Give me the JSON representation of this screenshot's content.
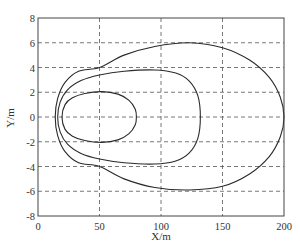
{
  "chart_data": {
    "type": "line",
    "title": "",
    "xlabel": "X/m",
    "ylabel": "Y/m",
    "xlim": [
      0,
      200
    ],
    "ylim": [
      -8,
      8
    ],
    "xticks": [
      0,
      50,
      100,
      150,
      200
    ],
    "yticks": [
      -8,
      -6,
      -4,
      -2,
      0,
      2,
      4,
      6,
      8
    ],
    "grid": true,
    "grid_style": "dashed",
    "legend": null,
    "series": [
      {
        "name": "inner loop",
        "closed": true,
        "points": [
          [
            19.5,
            0
          ],
          [
            22,
            1.0
          ],
          [
            28,
            1.55
          ],
          [
            38,
            1.9
          ],
          [
            52,
            2.05
          ],
          [
            65,
            1.85
          ],
          [
            74,
            1.35
          ],
          [
            79,
            0.65
          ],
          [
            80,
            0
          ],
          [
            79,
            -0.65
          ],
          [
            74,
            -1.35
          ],
          [
            65,
            -1.85
          ],
          [
            52,
            -2.05
          ],
          [
            38,
            -1.9
          ],
          [
            28,
            -1.55
          ],
          [
            22,
            -1.0
          ],
          [
            19.5,
            0
          ]
        ]
      },
      {
        "name": "middle loop",
        "closed": true,
        "points": [
          [
            16,
            0
          ],
          [
            18,
            1.2
          ],
          [
            24,
            2.2
          ],
          [
            35,
            2.95
          ],
          [
            50,
            3.4
          ],
          [
            70,
            3.7
          ],
          [
            95,
            3.8
          ],
          [
            112,
            3.55
          ],
          [
            123,
            2.9
          ],
          [
            130,
            1.7
          ],
          [
            132,
            0
          ],
          [
            130,
            -1.7
          ],
          [
            123,
            -2.9
          ],
          [
            112,
            -3.55
          ],
          [
            95,
            -3.8
          ],
          [
            70,
            -3.7
          ],
          [
            50,
            -3.4
          ],
          [
            35,
            -2.95
          ],
          [
            24,
            -2.2
          ],
          [
            18,
            -1.2
          ],
          [
            16,
            0
          ]
        ]
      },
      {
        "name": "outer loop",
        "closed": true,
        "points": [
          [
            14,
            0
          ],
          [
            16,
            1.5
          ],
          [
            22,
            2.8
          ],
          [
            33,
            3.7
          ],
          [
            50,
            4.0
          ],
          [
            70,
            5.0
          ],
          [
            95,
            5.7
          ],
          [
            123,
            6.0
          ],
          [
            150,
            5.6
          ],
          [
            172,
            4.6
          ],
          [
            188,
            3.2
          ],
          [
            197,
            1.6
          ],
          [
            200,
            0
          ],
          [
            197,
            -1.6
          ],
          [
            188,
            -3.2
          ],
          [
            172,
            -4.6
          ],
          [
            150,
            -5.6
          ],
          [
            123,
            -5.9
          ],
          [
            95,
            -5.7
          ],
          [
            70,
            -5.0
          ],
          [
            50,
            -4.0
          ],
          [
            33,
            -3.7
          ],
          [
            22,
            -2.8
          ],
          [
            16,
            -1.5
          ],
          [
            14,
            0
          ]
        ]
      }
    ]
  },
  "colors": {
    "curve": "#2a2a2a",
    "grid": "#555555",
    "axis": "#444444"
  }
}
